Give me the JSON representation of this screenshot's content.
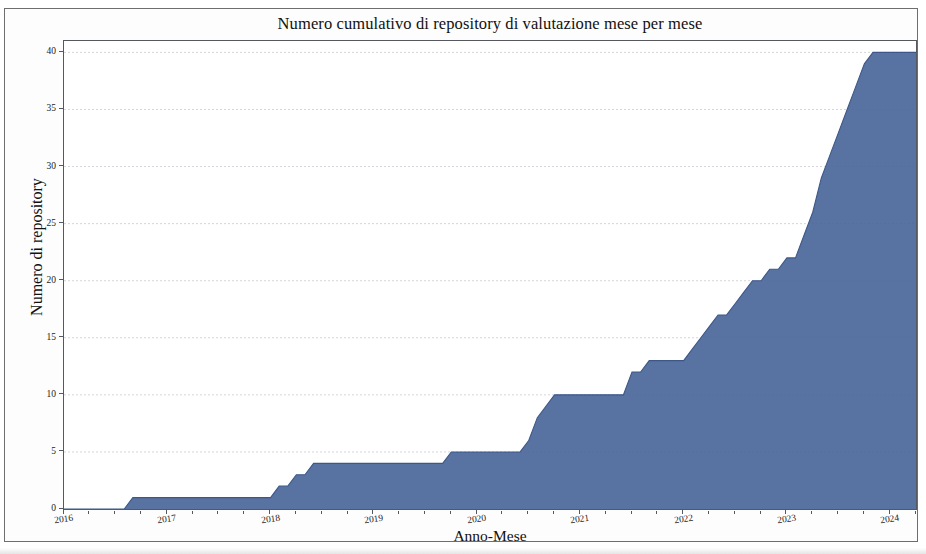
{
  "figure": {
    "title": "Numero cumulativo di repository di valutazione mese per mese",
    "xlabel": "Anno-Mese",
    "ylabel": "Numero di repository",
    "series_color": "#4a6699",
    "axis_color": "#55585e",
    "grid_color": "#c9ccd2",
    "background": "#ffffff"
  },
  "chart_data": {
    "type": "area",
    "title": "Numero cumulativo di repository di valutazione mese per mese",
    "xlabel": "Anno-Mese",
    "ylabel": "Numero di repository",
    "grid": true,
    "legend": "none",
    "color": "#4a6699",
    "xlim": [
      "2016-01",
      "2024-04"
    ],
    "ylim": [
      0,
      41
    ],
    "yticks": [
      0,
      5,
      10,
      15,
      20,
      25,
      30,
      35,
      40
    ],
    "ytick_labels": [
      "0",
      "5",
      "10",
      "15",
      "20",
      "25",
      "30",
      "35",
      "40"
    ],
    "xticks": [
      "2016",
      "2017",
      "2018",
      "2019",
      "2020",
      "2021",
      "2022",
      "2023",
      "2024"
    ],
    "xtick_labels": [
      "2016",
      "2017",
      "2018",
      "2019",
      "2020",
      "2021",
      "2022",
      "2023",
      "2024"
    ],
    "x": [
      "2016-01",
      "2016-02",
      "2016-03",
      "2016-04",
      "2016-05",
      "2016-06",
      "2016-07",
      "2016-08",
      "2016-09",
      "2016-10",
      "2016-11",
      "2016-12",
      "2017-01",
      "2017-02",
      "2017-03",
      "2017-04",
      "2017-05",
      "2017-06",
      "2017-07",
      "2017-08",
      "2017-09",
      "2017-10",
      "2017-11",
      "2017-12",
      "2018-01",
      "2018-02",
      "2018-03",
      "2018-04",
      "2018-05",
      "2018-06",
      "2018-07",
      "2018-08",
      "2018-09",
      "2018-10",
      "2018-11",
      "2018-12",
      "2019-01",
      "2019-02",
      "2019-03",
      "2019-04",
      "2019-05",
      "2019-06",
      "2019-07",
      "2019-08",
      "2019-09",
      "2019-10",
      "2019-11",
      "2019-12",
      "2020-01",
      "2020-02",
      "2020-03",
      "2020-04",
      "2020-05",
      "2020-06",
      "2020-07",
      "2020-08",
      "2020-09",
      "2020-10",
      "2020-11",
      "2020-12",
      "2021-01",
      "2021-02",
      "2021-03",
      "2021-04",
      "2021-05",
      "2021-06",
      "2021-07",
      "2021-08",
      "2021-09",
      "2021-10",
      "2021-11",
      "2021-12",
      "2022-01",
      "2022-02",
      "2022-03",
      "2022-04",
      "2022-05",
      "2022-06",
      "2022-07",
      "2022-08",
      "2022-09",
      "2022-10",
      "2022-11",
      "2022-12",
      "2023-01",
      "2023-02",
      "2023-03",
      "2023-04",
      "2023-05",
      "2023-06",
      "2023-07",
      "2023-08",
      "2023-09",
      "2023-10",
      "2023-11",
      "2023-12",
      "2024-01",
      "2024-02",
      "2024-03",
      "2024-04"
    ],
    "values": [
      0,
      0,
      0,
      0,
      0,
      0,
      0,
      0,
      1,
      1,
      1,
      1,
      1,
      1,
      1,
      1,
      1,
      1,
      1,
      1,
      1,
      1,
      1,
      1,
      1,
      2,
      2,
      3,
      3,
      4,
      4,
      4,
      4,
      4,
      4,
      4,
      4,
      4,
      4,
      4,
      4,
      4,
      4,
      4,
      4,
      5,
      5,
      5,
      5,
      5,
      5,
      5,
      5,
      5,
      6,
      8,
      9,
      10,
      10,
      10,
      10,
      10,
      10,
      10,
      10,
      10,
      12,
      12,
      13,
      13,
      13,
      13,
      13,
      14,
      15,
      16,
      17,
      17,
      18,
      19,
      20,
      20,
      21,
      21,
      22,
      22,
      24,
      26,
      29,
      31,
      33,
      35,
      37,
      39,
      40,
      40,
      40,
      40,
      40,
      40
    ],
    "series": [
      {
        "name": "Numero cumulativo di repository",
        "values": [
          0,
          0,
          0,
          0,
          0,
          0,
          0,
          0,
          1,
          1,
          1,
          1,
          1,
          1,
          1,
          1,
          1,
          1,
          1,
          1,
          1,
          1,
          1,
          1,
          1,
          2,
          2,
          3,
          3,
          4,
          4,
          4,
          4,
          4,
          4,
          4,
          4,
          4,
          4,
          4,
          4,
          4,
          4,
          4,
          4,
          5,
          5,
          5,
          5,
          5,
          5,
          5,
          5,
          5,
          6,
          8,
          9,
          10,
          10,
          10,
          10,
          10,
          10,
          10,
          10,
          10,
          12,
          12,
          13,
          13,
          13,
          13,
          13,
          14,
          15,
          16,
          17,
          17,
          18,
          19,
          20,
          20,
          21,
          21,
          22,
          22,
          24,
          26,
          29,
          31,
          33,
          35,
          37,
          39,
          40,
          40,
          40,
          40,
          40,
          40
        ]
      }
    ],
    "final_value": 40,
    "max_value": 40,
    "min_value": 0
  }
}
